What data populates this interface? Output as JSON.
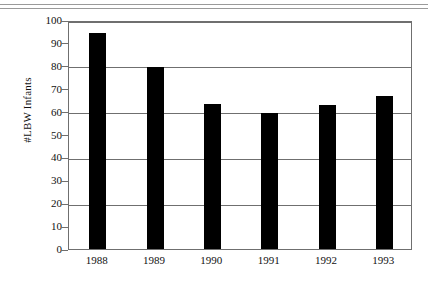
{
  "figure": {
    "top_rule": "double-horizontal-rule"
  },
  "chart_data": {
    "type": "bar",
    "title": "",
    "xlabel": "",
    "ylabel": "#LBW Infants",
    "categories": [
      "1988",
      "1989",
      "1990",
      "1991",
      "1992",
      "1993"
    ],
    "values": [
      94.5,
      79.5,
      63.5,
      59.5,
      63,
      67
    ],
    "series": [
      {
        "name": "#LBW Infants",
        "values": [
          94.5,
          79.5,
          63.5,
          59.5,
          63,
          67
        ]
      }
    ],
    "ylim": [
      0,
      100
    ],
    "y_ticks": [
      0,
      10,
      20,
      30,
      40,
      50,
      60,
      70,
      80,
      90,
      100
    ],
    "y_tick_labels": [
      "0",
      "10",
      "20",
      "30",
      "40",
      "50",
      "60",
      "70",
      "80",
      "90",
      "100"
    ],
    "gridlines_at": [
      20,
      40,
      60,
      80,
      100
    ],
    "grid": "horizontal",
    "legend": "none",
    "bar_color": "#000000",
    "axis_color": "#6f6f6f"
  }
}
